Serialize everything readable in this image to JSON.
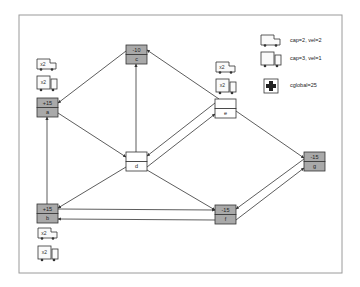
{
  "frame": {
    "x": 19,
    "y": 15,
    "w": 323,
    "h": 258,
    "stroke": "#9a9a9a"
  },
  "colors": {
    "supply_fill": "#a9a9a9",
    "neutral_fill": "#ffffff",
    "stroke": "#333333",
    "edge": "#333333"
  },
  "nodes": [
    {
      "id": "a",
      "label": "a",
      "value": "+15",
      "x": 37,
      "y": 98,
      "w": 21,
      "h": 19,
      "filled": true
    },
    {
      "id": "b",
      "label": "b",
      "value": "+15",
      "x": 37,
      "y": 204,
      "w": 21,
      "h": 19,
      "filled": true
    },
    {
      "id": "c",
      "label": "c",
      "value": "-10",
      "x": 126,
      "y": 45,
      "w": 21,
      "h": 19,
      "filled": true
    },
    {
      "id": "d",
      "label": "d",
      "value": "",
      "x": 126,
      "y": 152,
      "w": 21,
      "h": 19,
      "filled": false
    },
    {
      "id": "e",
      "label": "e",
      "value": "",
      "x": 215,
      "y": 99,
      "w": 21,
      "h": 19,
      "filled": false
    },
    {
      "id": "f",
      "label": "f",
      "value": "-15",
      "x": 215,
      "y": 205,
      "w": 21,
      "h": 19,
      "filled": true
    },
    {
      "id": "g",
      "label": "g",
      "value": "-15",
      "x": 304,
      "y": 152,
      "w": 21,
      "h": 19,
      "filled": true
    }
  ],
  "edges": [
    {
      "from": "c",
      "to": "a",
      "x1": 126,
      "y1": 51,
      "x2": 58,
      "y2": 103
    },
    {
      "from": "a",
      "to": "d",
      "x1": 58,
      "y1": 113,
      "x2": 126,
      "y2": 157
    },
    {
      "from": "b",
      "to": "a",
      "x1": 47,
      "y1": 204,
      "x2": 47,
      "y2": 117
    },
    {
      "from": "d",
      "to": "b",
      "x1": 126,
      "y1": 167,
      "x2": 58,
      "y2": 208
    },
    {
      "from": "d",
      "to": "c",
      "x1": 136,
      "y1": 152,
      "x2": 136,
      "y2": 64
    },
    {
      "from": "e",
      "to": "c",
      "x1": 219,
      "y1": 99,
      "x2": 147,
      "y2": 50
    },
    {
      "from": "e",
      "to": "d",
      "x1": 215,
      "y1": 103,
      "x2": 147,
      "y2": 156
    },
    {
      "from": "d",
      "to": "e",
      "x1": 147,
      "y1": 167,
      "x2": 215,
      "y2": 114
    },
    {
      "from": "e",
      "to": "g",
      "x1": 236,
      "y1": 111,
      "x2": 304,
      "y2": 158
    },
    {
      "from": "d",
      "to": "f",
      "x1": 147,
      "y1": 170,
      "x2": 215,
      "y2": 210
    },
    {
      "from": "b",
      "to": "f",
      "x1": 58,
      "y1": 209,
      "x2": 215,
      "y2": 210
    },
    {
      "from": "f",
      "to": "b",
      "x1": 215,
      "y1": 220,
      "x2": 58,
      "y2": 219
    },
    {
      "from": "g",
      "to": "f",
      "x1": 304,
      "y1": 159,
      "x2": 236,
      "y2": 209
    },
    {
      "from": "f",
      "to": "g",
      "x1": 236,
      "y1": 220,
      "x2": 304,
      "y2": 168
    }
  ],
  "trucks": [
    {
      "type": "small",
      "label": "x2",
      "x": 37,
      "y": 59,
      "near": "a"
    },
    {
      "type": "big",
      "label": "x2",
      "x": 37,
      "y": 76,
      "near": "a"
    },
    {
      "type": "small",
      "label": "x2",
      "x": 216,
      "y": 62,
      "near": "e"
    },
    {
      "type": "big",
      "label": "x2",
      "x": 216,
      "y": 79,
      "near": "e"
    },
    {
      "type": "small",
      "label": "x2",
      "x": 38,
      "y": 228,
      "near": "b"
    },
    {
      "type": "big",
      "label": "x2",
      "x": 38,
      "y": 246,
      "near": "b"
    }
  ],
  "legend": {
    "small_truck": {
      "text": "cap=2, vel=2",
      "x": 261,
      "y": 35
    },
    "big_truck": {
      "text": "cap=3, vel=1",
      "x": 261,
      "y": 52
    },
    "hospital": {
      "text": "cglobal=25",
      "x": 264,
      "y": 79
    }
  }
}
